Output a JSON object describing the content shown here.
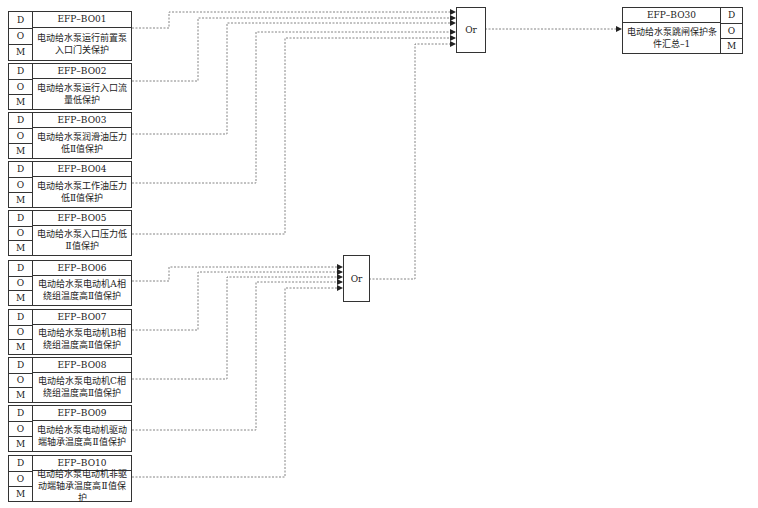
{
  "diagram": {
    "inputs": [
      {
        "code": "EFP–BO01",
        "desc": "电动给水泵运行前置泵入口门关保护",
        "d": "D",
        "o": "O",
        "m": "M"
      },
      {
        "code": "EFP–BO02",
        "desc": "电动给水泵运行入口流量低保护",
        "d": "D",
        "o": "O",
        "m": "M"
      },
      {
        "code": "EFP–BO03",
        "desc": "电动给水泵润滑油压力低Ⅱ值保护",
        "d": "D",
        "o": "O",
        "m": "M"
      },
      {
        "code": "EFP–BO04",
        "desc": "电动给水泵工作油压力低Ⅱ值保护",
        "d": "D",
        "o": "O",
        "m": "M"
      },
      {
        "code": "EFP–BO05",
        "desc": "电动给水泵入口压力低Ⅱ值保护",
        "d": "D",
        "o": "O",
        "m": "M"
      },
      {
        "code": "EFP–BO06",
        "desc": "电动给水泵电动机A相绕组温度高Ⅱ值保护",
        "d": "D",
        "o": "O",
        "m": "M"
      },
      {
        "code": "EFP–BO07",
        "desc": "电动给水泵电动机B相绕组温度高Ⅱ值保护",
        "d": "D",
        "o": "O",
        "m": "M"
      },
      {
        "code": "EFP–BO08",
        "desc": "电动给水泵电动机C相绕组温度高Ⅱ值保护",
        "d": "D",
        "o": "O",
        "m": "M"
      },
      {
        "code": "EFP–BO09",
        "desc": "电动给水泵电动机驱动端轴承温度高Ⅱ值保护",
        "d": "D",
        "o": "O",
        "m": "M"
      },
      {
        "code": "EFP–BO10",
        "desc": "电动给水泵电动机非驱动端轴承温度高Ⅱ值保护",
        "d": "D",
        "o": "O",
        "m": "M"
      }
    ],
    "gates": [
      {
        "id": "or-main",
        "label": "Or"
      },
      {
        "id": "or-temp",
        "label": "Or"
      }
    ],
    "output": {
      "code": "EFP–BO30",
      "desc": "电动给水泵跳闸保护条件汇总–1",
      "d": "D",
      "o": "O",
      "m": "M"
    },
    "colors": {
      "line": "#333333",
      "wire": "#555555",
      "background": "#ffffff"
    }
  }
}
